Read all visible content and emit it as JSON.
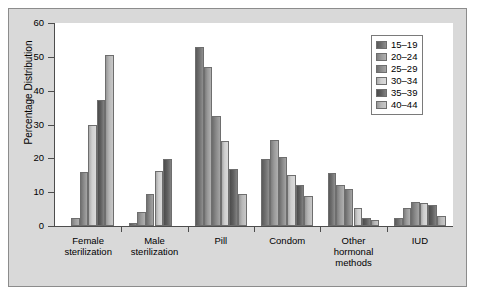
{
  "chart_data": {
    "type": "bar",
    "title": "",
    "xlabel": "",
    "ylabel": "Percentage Distribution",
    "ylim": [
      0,
      60
    ],
    "yticks": [
      0,
      10,
      20,
      30,
      40,
      50,
      60
    ],
    "grid": false,
    "legend_position": "top-right",
    "categories": [
      "Female sterilization",
      "Male sterilization",
      "Pill",
      "Condom",
      "Other hormonal methods",
      "IUD"
    ],
    "category_lines": [
      [
        "Female",
        "sterilization"
      ],
      [
        "Male",
        "sterilization"
      ],
      [
        "Pill"
      ],
      [
        "Condom"
      ],
      [
        "Other",
        "hormonal",
        "methods"
      ],
      [
        "IUD"
      ]
    ],
    "series": [
      {
        "name": "15–19",
        "color": "#6e6e6e",
        "values": [
          0,
          0.8,
          53.0,
          19.8,
          15.7,
          2.4
        ]
      },
      {
        "name": "20–24",
        "color": "#9a9a9a",
        "values": [
          2.5,
          4.1,
          47.0,
          25.3,
          12.0,
          5.4
        ]
      },
      {
        "name": "25–29",
        "color": "#8a8a8a",
        "values": [
          16.1,
          9.4,
          32.5,
          20.4,
          11.0,
          7.0
        ]
      },
      {
        "name": "30–34",
        "color": "#cfcfcf",
        "values": [
          29.9,
          16.4,
          25.0,
          15.1,
          5.4,
          6.8
        ]
      },
      {
        "name": "35–39",
        "color": "#5e5e5e",
        "values": [
          37.2,
          19.8,
          16.8,
          12.0,
          2.4,
          6.2
        ]
      },
      {
        "name": "40–44",
        "color": "#b8b8b8",
        "values": [
          50.5,
          0,
          9.6,
          8.8,
          1.7,
          2.9
        ]
      }
    ]
  },
  "legend": {
    "entries": [
      "15–19",
      "20–24",
      "25–29",
      "30–34",
      "35–39",
      "40–44"
    ]
  }
}
